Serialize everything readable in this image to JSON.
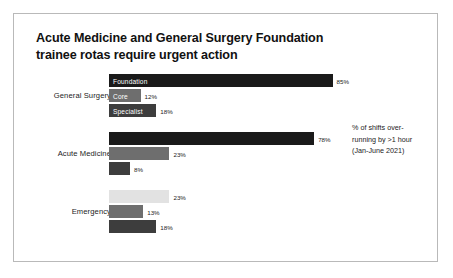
{
  "title": {
    "line1": "Acute Medicine and General Surgery Foundation",
    "line2": "trainee rotas require urgent action"
  },
  "annotation": {
    "line1": "% of shifts over-",
    "line2": "running by >1 hour",
    "line3": "(Jan-June 2021)"
  },
  "colors": {
    "foundation": "#1a1a1a",
    "core": "#6e6e6e",
    "specialist": "#3d3d3d",
    "light": "#e2e2e2",
    "border": "#b9b9b9",
    "text": "#1a1a1a"
  },
  "chart_data": {
    "type": "bar",
    "title": "Acute Medicine and General Surgery Foundation trainee rotas require urgent action",
    "subtitle": "% of shifts over-running by >1 hour (Jan-June 2021)",
    "orientation": "horizontal",
    "xlabel": "",
    "ylabel": "",
    "xlim": [
      0,
      100
    ],
    "grid": false,
    "legend": "none",
    "categories": [
      "General Surgery",
      "Acute Medicine",
      "Emergency"
    ],
    "series": [
      {
        "name": "Foundation",
        "values": [
          85,
          78,
          23
        ]
      },
      {
        "name": "Core",
        "values": [
          12,
          23,
          13
        ]
      },
      {
        "name": "Specialist",
        "values": [
          18,
          8,
          18
        ]
      }
    ],
    "groups": [
      {
        "category": "General Surgery",
        "bars": [
          {
            "series": "Foundation",
            "label": "Foundation",
            "value": 85,
            "value_text": "85%",
            "color": "#1a1a1a",
            "show_series_label": true
          },
          {
            "series": "Core",
            "label": "Core",
            "value": 12,
            "value_text": "12%",
            "color": "#6e6e6e",
            "show_series_label": true
          },
          {
            "series": "Specialist",
            "label": "Specialist",
            "value": 18,
            "value_text": "18%",
            "color": "#3d3d3d",
            "show_series_label": true
          }
        ]
      },
      {
        "category": "Acute Medicine",
        "bars": [
          {
            "series": "Foundation",
            "label": "",
            "value": 78,
            "value_text": "78%",
            "color": "#1a1a1a",
            "show_series_label": false
          },
          {
            "series": "Core",
            "label": "",
            "value": 23,
            "value_text": "23%",
            "color": "#6e6e6e",
            "show_series_label": false
          },
          {
            "series": "Specialist",
            "label": "",
            "value": 8,
            "value_text": "8%",
            "color": "#3d3d3d",
            "show_series_label": false
          }
        ]
      },
      {
        "category": "Emergency",
        "bars": [
          {
            "series": "Foundation",
            "label": "",
            "value": 23,
            "value_text": "23%",
            "color": "#e2e2e2",
            "show_series_label": false
          },
          {
            "series": "Core",
            "label": "",
            "value": 13,
            "value_text": "13%",
            "color": "#6e6e6e",
            "show_series_label": false
          },
          {
            "series": "Specialist",
            "label": "",
            "value": 18,
            "value_text": "18%",
            "color": "#3d3d3d",
            "show_series_label": false
          }
        ]
      }
    ]
  }
}
